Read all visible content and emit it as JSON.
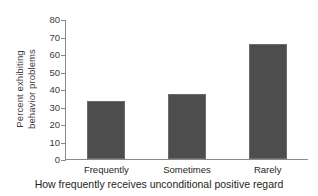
{
  "chart_data": {
    "type": "bar",
    "title": "",
    "subtitle": "",
    "xlabel": "How frequently receives unconditional positive regard",
    "ylabel_lines": [
      "Percent exhibiting",
      "behavior problems"
    ],
    "ylabel": "Percent exhibiting behavior problems",
    "categories": [
      "Frequently",
      "Sometimes",
      "Rarely"
    ],
    "values": [
      33,
      37,
      65.5
    ],
    "ylim": [
      0,
      80
    ],
    "yticks": [
      0,
      10,
      20,
      30,
      40,
      50,
      60,
      70,
      80
    ],
    "ytick_labels": [
      "0",
      "10",
      "20",
      "30",
      "40",
      "50",
      "60",
      "70",
      "80"
    ],
    "grid": false,
    "legend": null,
    "bar_color": "#4d4d4d",
    "axis_color": "#8a8a8a"
  }
}
